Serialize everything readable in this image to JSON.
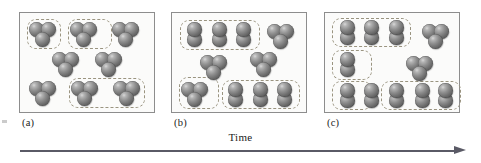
{
  "figure": {
    "caption_axis_label": "Time",
    "panels": [
      {
        "id": "a",
        "label": "(a)",
        "triatomic_count": 8,
        "diatomic_count": 0,
        "molecules": [
          {
            "type": "triatomic",
            "x": 22,
            "y": 20
          },
          {
            "type": "triatomic",
            "x": 63,
            "y": 20
          },
          {
            "type": "triatomic",
            "x": 105,
            "y": 20
          },
          {
            "type": "triatomic",
            "x": 45,
            "y": 50
          },
          {
            "type": "triatomic",
            "x": 88,
            "y": 50
          },
          {
            "type": "triatomic",
            "x": 22,
            "y": 79
          },
          {
            "type": "triatomic",
            "x": 64,
            "y": 79
          },
          {
            "type": "triatomic",
            "x": 106,
            "y": 79
          }
        ],
        "groups": [
          {
            "x": 7,
            "y": 6,
            "w": 34,
            "h": 30
          },
          {
            "x": 48,
            "y": 6,
            "w": 44,
            "h": 30
          },
          {
            "x": 49,
            "y": 65,
            "w": 76,
            "h": 30
          }
        ]
      },
      {
        "id": "b",
        "label": "(b)",
        "triatomic_count": 4,
        "diatomic_count": 6,
        "molecules": [
          {
            "type": "diatomic",
            "x": 22,
            "y": 21
          },
          {
            "type": "diatomic",
            "x": 47,
            "y": 21
          },
          {
            "type": "diatomic",
            "x": 71,
            "y": 21
          },
          {
            "type": "triatomic",
            "x": 108,
            "y": 22
          },
          {
            "type": "triatomic",
            "x": 41,
            "y": 53
          },
          {
            "type": "triatomic",
            "x": 91,
            "y": 50
          },
          {
            "type": "triatomic",
            "x": 22,
            "y": 80
          },
          {
            "type": "diatomic",
            "x": 63,
            "y": 81
          },
          {
            "type": "diatomic",
            "x": 88,
            "y": 81
          },
          {
            "type": "diatomic",
            "x": 112,
            "y": 81
          }
        ],
        "groups": [
          {
            "x": 8,
            "y": 7,
            "w": 80,
            "h": 30
          },
          {
            "x": 7,
            "y": 64,
            "w": 40,
            "h": 32
          },
          {
            "x": 50,
            "y": 67,
            "w": 78,
            "h": 29
          }
        ]
      },
      {
        "id": "c",
        "label": "(c)",
        "triatomic_count": 2,
        "diatomic_count": 8,
        "molecules": [
          {
            "type": "diatomic",
            "x": 22,
            "y": 19
          },
          {
            "type": "diatomic",
            "x": 46,
            "y": 19
          },
          {
            "type": "diatomic",
            "x": 71,
            "y": 19
          },
          {
            "type": "triatomic",
            "x": 110,
            "y": 22
          },
          {
            "type": "diatomic",
            "x": 22,
            "y": 51
          },
          {
            "type": "triatomic",
            "x": 94,
            "y": 54
          },
          {
            "type": "diatomic",
            "x": 22,
            "y": 82
          },
          {
            "type": "diatomic",
            "x": 46,
            "y": 82
          },
          {
            "type": "diatomic",
            "x": 71,
            "y": 82
          },
          {
            "type": "diatomic",
            "x": 97,
            "y": 82
          },
          {
            "type": "diatomic",
            "x": 120,
            "y": 82
          }
        ],
        "groups": [
          {
            "x": 7,
            "y": 5,
            "w": 79,
            "h": 29
          },
          {
            "x": 7,
            "y": 37,
            "w": 40,
            "h": 30
          },
          {
            "x": 7,
            "y": 68,
            "w": 40,
            "h": 29
          },
          {
            "x": 56,
            "y": 68,
            "w": 80,
            "h": 29
          }
        ]
      }
    ]
  }
}
